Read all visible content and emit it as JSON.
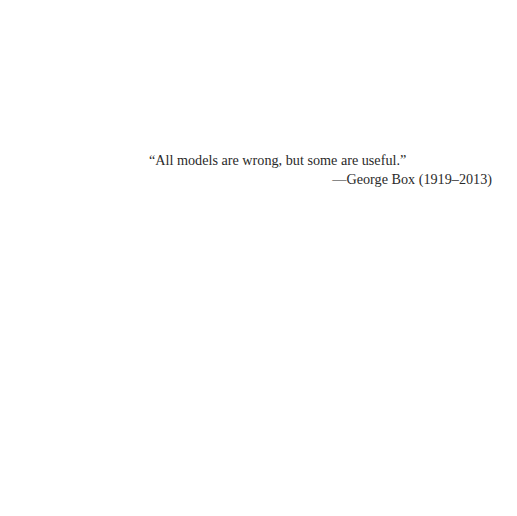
{
  "epigraph": {
    "quote": "“All models are wrong, but some are useful.”",
    "attribution": "—George Box (1919–2013)"
  }
}
